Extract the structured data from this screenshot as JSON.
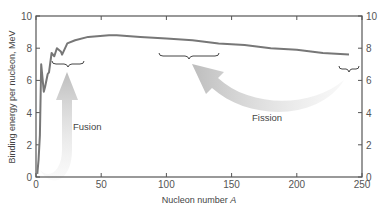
{
  "chart_data": {
    "type": "line",
    "title": "",
    "xlabel": "Nucleon number A",
    "ylabel": "Binding energy per nucleon, MeV",
    "xlim": [
      0,
      250
    ],
    "ylim": [
      0,
      10
    ],
    "x_ticks": [
      "0",
      "50",
      "100",
      "150",
      "200",
      "250"
    ],
    "y_ticks": [
      "0",
      "2",
      "4",
      "6",
      "8",
      "10"
    ],
    "y_ticks_right": [
      "0",
      "2",
      "4",
      "6",
      "8",
      "10"
    ],
    "grid": false,
    "series": [
      {
        "name": "Binding energy per nucleon",
        "x": [
          1,
          2,
          3,
          4,
          6,
          7,
          9,
          10,
          12,
          14,
          16,
          19,
          20,
          24,
          30,
          40,
          56,
          62,
          80,
          100,
          120,
          140,
          160,
          180,
          200,
          220,
          240
        ],
        "y": [
          0.2,
          1.1,
          2.6,
          7.0,
          5.3,
          5.6,
          6.4,
          6.5,
          7.7,
          7.5,
          8.0,
          7.8,
          7.6,
          8.3,
          8.5,
          8.7,
          8.8,
          8.8,
          8.7,
          8.6,
          8.5,
          8.3,
          8.2,
          8.0,
          7.9,
          7.7,
          7.6
        ]
      }
    ],
    "annotations": [
      {
        "text": "Fusion",
        "type": "arrow",
        "from_x": 10,
        "from_y": 0.5,
        "to_x": 22,
        "to_y": 6.4
      },
      {
        "text": "Fission",
        "type": "arrow",
        "from_x": 235,
        "from_y": 6.0,
        "to_x": 120,
        "to_y": 7.0
      },
      {
        "type": "brace",
        "x_range": [
          12,
          30
        ],
        "y": 6.9
      },
      {
        "type": "brace",
        "x_range": [
          95,
          145
        ],
        "y": 7.7
      },
      {
        "type": "brace",
        "x_range": [
          235,
          248
        ],
        "y": 6.8
      }
    ]
  },
  "labels": {
    "xlabel": "Nucleon number ",
    "xlabel_var": "A",
    "ylabel": "Binding energy per nucleon, MeV",
    "fusion": "Fusion",
    "fission": "Fission"
  }
}
